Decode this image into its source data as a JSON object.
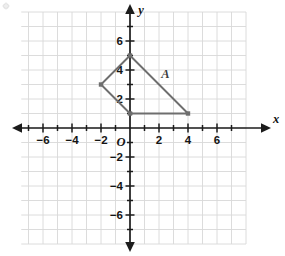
{
  "chart_data": {
    "type": "scatter",
    "title": "",
    "subtitle": "",
    "xlabel": "x",
    "ylabel": "y",
    "xlim": [
      -7.5,
      8
    ],
    "ylim": [
      -8,
      8
    ],
    "grid": true,
    "grid_step": 1,
    "legend": "none",
    "x_tick_labels": [
      "−6",
      "−4",
      "−2",
      "2",
      "4",
      "6"
    ],
    "x_tick_values": [
      -6,
      -4,
      -2,
      2,
      4,
      6
    ],
    "y_tick_labels": [
      "6",
      "4",
      "2",
      "−2",
      "−4",
      "−6"
    ],
    "y_tick_values": [
      6,
      4,
      2,
      -2,
      -4,
      -6
    ],
    "origin_label": "O",
    "minor_tick_values_x": [
      -7,
      -5,
      -3,
      -1,
      1,
      3,
      5,
      7
    ],
    "minor_tick_values_y": [
      -7,
      -5,
      -3,
      -1,
      1,
      3,
      5,
      7
    ],
    "shapes": [
      {
        "name": "A",
        "label": "A",
        "label_position": [
          2.45,
          3.45
        ],
        "kind": "polygon",
        "closed": true,
        "vertices": [
          [
            0,
            5
          ],
          [
            -2,
            3
          ],
          [
            0,
            1
          ],
          [
            4,
            1
          ]
        ],
        "vertex_markers": true,
        "stroke": "#6e6e6e",
        "fill": "none"
      }
    ],
    "colors": {
      "grid_line": "#d8d8d8",
      "axis_line": "#1c1c1c",
      "shape_stroke": "#6e6e6e",
      "tick_text": "#141414",
      "background": "#ffffff"
    }
  }
}
